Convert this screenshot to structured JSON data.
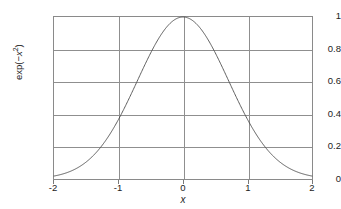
{
  "chart_data": {
    "type": "line",
    "title": "",
    "subtitle": "",
    "xlabel": "x",
    "ylabel": "exp(-x²)",
    "ylabel_parts": {
      "prefix": "exp(−",
      "base": "x",
      "exponent": "2",
      "suffix": ")"
    },
    "xlim": [
      -2,
      2
    ],
    "ylim": [
      0,
      1
    ],
    "grid": true,
    "legend": null,
    "legend_position": "none",
    "xticks": [
      "-2",
      "-1",
      "0",
      "1",
      "2"
    ],
    "xtick_values": [
      -2,
      -1,
      0,
      1,
      2
    ],
    "yticks": [
      "0",
      "0.2",
      "0.4",
      "0.6",
      "0.8",
      "1"
    ],
    "ytick_values": [
      0,
      0.2,
      0.4,
      0.6,
      0.8,
      1
    ],
    "series": [
      {
        "name": "exp(-x^2)",
        "color": "#4d4d4d",
        "x": [
          -2,
          -1.9,
          -1.8,
          -1.7,
          -1.6,
          -1.5,
          -1.4,
          -1.3,
          -1.2,
          -1.1,
          -1,
          -0.9,
          -0.8,
          -0.7,
          -0.6,
          -0.5,
          -0.4,
          -0.3,
          -0.2,
          -0.1,
          0,
          0.1,
          0.2,
          0.3,
          0.4,
          0.5,
          0.6,
          0.7,
          0.8,
          0.9,
          1,
          1.1,
          1.2,
          1.3,
          1.4,
          1.5,
          1.6,
          1.7,
          1.8,
          1.9,
          2
        ],
        "y": [
          0.0183,
          0.0273,
          0.0392,
          0.0546,
          0.0773,
          0.1054,
          0.1409,
          0.1845,
          0.2369,
          0.2982,
          0.3679,
          0.4449,
          0.5273,
          0.6126,
          0.6977,
          0.7788,
          0.8521,
          0.9139,
          0.9608,
          0.99,
          1.0,
          0.99,
          0.9608,
          0.9139,
          0.8521,
          0.7788,
          0.6977,
          0.6126,
          0.5273,
          0.4449,
          0.3679,
          0.2982,
          0.2369,
          0.1845,
          0.1409,
          0.1054,
          0.0773,
          0.0546,
          0.0392,
          0.0273,
          0.0183
        ]
      }
    ],
    "annotations": [],
    "colors": {
      "curve": "#4d4d4d",
      "grid": "#8f8f8f",
      "axis": "#8a8a8a",
      "text": "#222222",
      "background": "#ffffff"
    }
  }
}
